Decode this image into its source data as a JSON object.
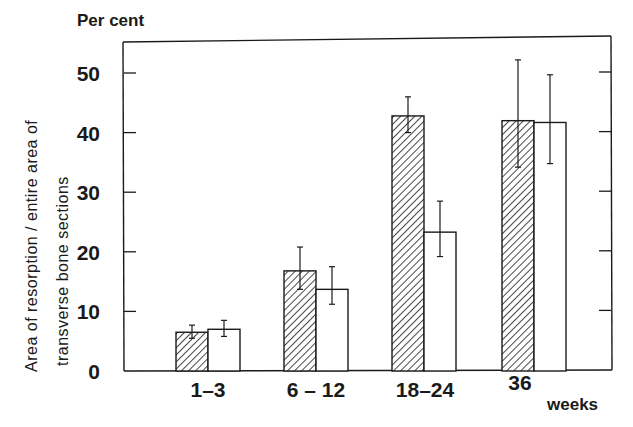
{
  "chart_data": {
    "type": "bar",
    "title": "",
    "ylabel_top": "Per cent",
    "ylabel_lines": [
      "Area of resorption / entire area of",
      "transverse bone sections"
    ],
    "xlabel": "weeks",
    "categories": [
      "1-3",
      "6-12",
      "18-24",
      "36"
    ],
    "yticks": [
      0,
      10,
      20,
      30,
      40,
      50
    ],
    "ylim": [
      0,
      55
    ],
    "grid": false,
    "legend": null,
    "series": [
      {
        "name": "hatched",
        "pattern": "diagonal-hatch",
        "values": [
          6.5,
          16.8,
          42.8,
          42.0
        ],
        "err_low": [
          5.5,
          13.7,
          40.0,
          34.2
        ],
        "err_high": [
          7.7,
          20.8,
          46.0,
          52.2
        ]
      },
      {
        "name": "open",
        "pattern": "white",
        "values": [
          7.0,
          13.7,
          23.3,
          41.7
        ],
        "err_low": [
          5.8,
          11.2,
          19.2,
          34.8
        ],
        "err_high": [
          8.5,
          17.5,
          28.5,
          49.7
        ]
      }
    ]
  },
  "colors": {
    "ink": "#1a1a1a",
    "background": "#ffffff"
  }
}
